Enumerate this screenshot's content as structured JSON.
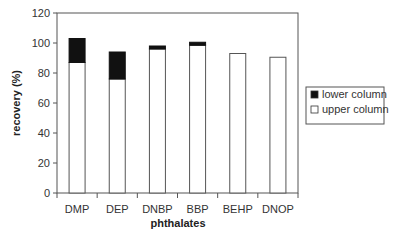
{
  "chart_data": {
    "type": "bar",
    "stacked": true,
    "title": "",
    "xlabel": "phthalates",
    "ylabel": "recovery (%)",
    "ylim": [
      0,
      120
    ],
    "yticks": [
      0,
      20,
      40,
      60,
      80,
      100,
      120
    ],
    "categories": [
      "DMP",
      "DEP",
      "DNBP",
      "BBP",
      "BEHP",
      "DNOP"
    ],
    "series": [
      {
        "name": "upper column",
        "color": "#ffffff",
        "values": [
          87,
          76,
          96,
          98.5,
          93,
          90.5
        ]
      },
      {
        "name": "lower column",
        "color": "#111111",
        "values": [
          16,
          18,
          2,
          2,
          0,
          0
        ]
      }
    ],
    "legend": {
      "position": "right",
      "entries": [
        "lower column",
        "upper column"
      ]
    },
    "grid": false
  }
}
